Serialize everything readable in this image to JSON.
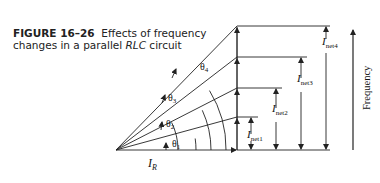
{
  "caption": {
    "figure_label": "FIGURE 16–26",
    "text_line1": "Effects of frequency",
    "text_line2_pre": "changes in a parallel ",
    "text_line2_em": "RLC",
    "text_line2_post": " circuit"
  },
  "diagram": {
    "base_vector": {
      "symbol": "I",
      "subscript": "R"
    },
    "angles": [
      {
        "symbol": "θ",
        "subscript": "1"
      },
      {
        "symbol": "θ",
        "subscript": "2"
      },
      {
        "symbol": "θ",
        "subscript": "3"
      },
      {
        "symbol": "θ",
        "subscript": "4"
      }
    ],
    "net_currents": [
      {
        "symbol": "I",
        "subscript": "net1"
      },
      {
        "symbol": "I",
        "subscript": "net2"
      },
      {
        "symbol": "I",
        "subscript": "net3"
      },
      {
        "symbol": "I",
        "subscript": "net4"
      }
    ],
    "axis_label": "Frequency",
    "line_color": "#222222"
  }
}
